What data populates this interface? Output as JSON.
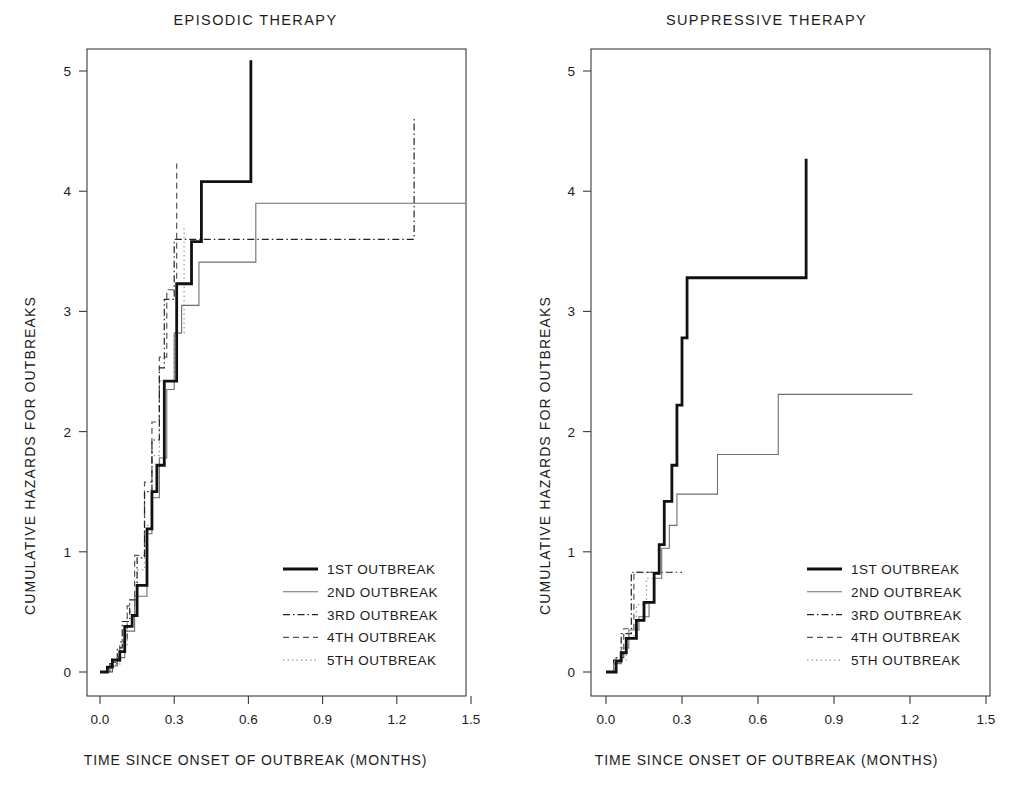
{
  "figure": {
    "width": 1022,
    "height": 795,
    "background": "#ffffff"
  },
  "panels": [
    {
      "id": "episodic",
      "title": "EPISODIC THERAPY",
      "xlabel": "TIME SINCE ONSET OF OUTBREAK (MONTHS)",
      "ylabel": "CUMULATIVE HAZARDS FOR OUTBREAKS",
      "x_ticks": [
        "0.0",
        "0.3",
        "0.6",
        "0.9",
        "1.2",
        "1.5"
      ],
      "y_ticks": [
        "0",
        "1",
        "2",
        "3",
        "4",
        "5"
      ]
    },
    {
      "id": "suppressive",
      "title": "SUPPRESSIVE THERAPY",
      "xlabel": "TIME SINCE ONSET OF OUTBREAK (MONTHS)",
      "ylabel": "CUMULATIVE HAZARDS FOR OUTBREAKS",
      "x_ticks": [
        "0.0",
        "0.3",
        "0.6",
        "0.9",
        "1.2",
        "1.5"
      ],
      "y_ticks": [
        "0",
        "1",
        "2",
        "3",
        "4",
        "5"
      ]
    }
  ],
  "legend": {
    "entries": [
      {
        "label": "1ST OUTBREAK",
        "style": "solid-thick",
        "color": "#111111",
        "width": 2.8,
        "dash": "none"
      },
      {
        "label": "2ND OUTBREAK",
        "style": "solid-thin",
        "color": "#6e6e6e",
        "width": 1.1,
        "dash": "none"
      },
      {
        "label": "3RD OUTBREAK",
        "style": "dash-dot",
        "color": "#222222",
        "width": 1.2,
        "dash": "7,3,1.5,3"
      },
      {
        "label": "4TH OUTBREAK",
        "style": "dashed",
        "color": "#555555",
        "width": 1.2,
        "dash": "6,4"
      },
      {
        "label": "5TH OUTBREAK",
        "style": "dotted",
        "color": "#9a9a9a",
        "width": 1.2,
        "dash": "1.5,3"
      }
    ]
  },
  "chart_data": {
    "type": "line",
    "subtype": "step-function (Nelson-Aalen cumulative hazard)",
    "xlabel": "TIME SINCE ONSET OF OUTBREAK (MONTHS)",
    "ylabel": "CUMULATIVE HAZARDS FOR OUTBREAKS",
    "xlim": [
      -0.07,
      1.62
    ],
    "ylim": [
      -0.23,
      5.45
    ],
    "xticks": [
      0.0,
      0.3,
      0.6,
      0.9,
      1.2,
      1.5
    ],
    "yticks": [
      0,
      1,
      2,
      3,
      4,
      5
    ],
    "grid": false,
    "legend_position": "lower right (inside panel)",
    "panels": [
      {
        "panel": "EPISODIC THERAPY",
        "series": [
          {
            "name": "1ST OUTBREAK",
            "style": "solid-thick",
            "points": [
              [
                0.0,
                0.0
              ],
              [
                0.03,
                0.0
              ],
              [
                0.03,
                0.04
              ],
              [
                0.05,
                0.04
              ],
              [
                0.05,
                0.1
              ],
              [
                0.08,
                0.1
              ],
              [
                0.08,
                0.17
              ],
              [
                0.1,
                0.17
              ],
              [
                0.1,
                0.38
              ],
              [
                0.13,
                0.38
              ],
              [
                0.13,
                0.47
              ],
              [
                0.15,
                0.47
              ],
              [
                0.15,
                0.72
              ],
              [
                0.19,
                0.72
              ],
              [
                0.19,
                1.19
              ],
              [
                0.21,
                1.19
              ],
              [
                0.21,
                1.5
              ],
              [
                0.23,
                1.5
              ],
              [
                0.23,
                1.72
              ],
              [
                0.26,
                1.72
              ],
              [
                0.26,
                2.42
              ],
              [
                0.31,
                2.42
              ],
              [
                0.31,
                3.23
              ],
              [
                0.37,
                3.23
              ],
              [
                0.37,
                3.58
              ],
              [
                0.41,
                3.58
              ],
              [
                0.41,
                4.08
              ],
              [
                0.61,
                4.08
              ],
              [
                0.61,
                5.09
              ]
            ]
          },
          {
            "name": "2ND OUTBREAK",
            "style": "solid-thin",
            "points": [
              [
                0.0,
                0.0
              ],
              [
                0.04,
                0.0
              ],
              [
                0.04,
                0.05
              ],
              [
                0.07,
                0.05
              ],
              [
                0.07,
                0.12
              ],
              [
                0.1,
                0.12
              ],
              [
                0.1,
                0.34
              ],
              [
                0.14,
                0.34
              ],
              [
                0.14,
                0.63
              ],
              [
                0.19,
                0.63
              ],
              [
                0.19,
                1.15
              ],
              [
                0.21,
                1.15
              ],
              [
                0.21,
                1.45
              ],
              [
                0.24,
                1.45
              ],
              [
                0.24,
                1.78
              ],
              [
                0.27,
                1.78
              ],
              [
                0.27,
                2.35
              ],
              [
                0.3,
                2.35
              ],
              [
                0.3,
                2.82
              ],
              [
                0.33,
                2.82
              ],
              [
                0.33,
                3.05
              ],
              [
                0.4,
                3.05
              ],
              [
                0.4,
                3.41
              ],
              [
                0.63,
                3.41
              ],
              [
                0.63,
                3.9
              ],
              [
                1.56,
                3.9
              ]
            ]
          },
          {
            "name": "3RD OUTBREAK",
            "style": "dash-dot",
            "points": [
              [
                0.0,
                0.0
              ],
              [
                0.04,
                0.0
              ],
              [
                0.04,
                0.07
              ],
              [
                0.07,
                0.07
              ],
              [
                0.07,
                0.2
              ],
              [
                0.09,
                0.2
              ],
              [
                0.09,
                0.42
              ],
              [
                0.12,
                0.42
              ],
              [
                0.12,
                0.6
              ],
              [
                0.15,
                0.6
              ],
              [
                0.15,
                0.95
              ],
              [
                0.18,
                0.95
              ],
              [
                0.18,
                1.5
              ],
              [
                0.21,
                1.5
              ],
              [
                0.21,
                1.93
              ],
              [
                0.24,
                1.93
              ],
              [
                0.24,
                2.53
              ],
              [
                0.26,
                2.53
              ],
              [
                0.26,
                3.1
              ],
              [
                0.3,
                3.1
              ],
              [
                0.3,
                3.6
              ],
              [
                1.27,
                3.6
              ],
              [
                1.27,
                4.6
              ]
            ]
          },
          {
            "name": "4TH OUTBREAK",
            "style": "dashed",
            "points": [
              [
                0.0,
                0.0
              ],
              [
                0.05,
                0.0
              ],
              [
                0.05,
                0.08
              ],
              [
                0.08,
                0.08
              ],
              [
                0.08,
                0.25
              ],
              [
                0.11,
                0.25
              ],
              [
                0.11,
                0.55
              ],
              [
                0.14,
                0.55
              ],
              [
                0.14,
                0.97
              ],
              [
                0.18,
                0.97
              ],
              [
                0.18,
                1.58
              ],
              [
                0.21,
                1.58
              ],
              [
                0.21,
                2.08
              ],
              [
                0.24,
                2.08
              ],
              [
                0.24,
                2.62
              ],
              [
                0.27,
                2.62
              ],
              [
                0.27,
                3.18
              ],
              [
                0.31,
                3.18
              ],
              [
                0.31,
                4.23
              ]
            ]
          },
          {
            "name": "5TH OUTBREAK",
            "style": "dotted",
            "points": [
              [
                0.0,
                0.0
              ],
              [
                0.04,
                0.0
              ],
              [
                0.04,
                0.06
              ],
              [
                0.08,
                0.06
              ],
              [
                0.08,
                0.22
              ],
              [
                0.11,
                0.22
              ],
              [
                0.11,
                0.5
              ],
              [
                0.15,
                0.5
              ],
              [
                0.15,
                0.85
              ],
              [
                0.18,
                0.85
              ],
              [
                0.18,
                1.22
              ],
              [
                0.21,
                1.22
              ],
              [
                0.21,
                1.8
              ],
              [
                0.24,
                1.8
              ],
              [
                0.24,
                2.42
              ],
              [
                0.3,
                2.42
              ],
              [
                0.3,
                2.82
              ],
              [
                0.34,
                2.82
              ],
              [
                0.34,
                3.72
              ]
            ]
          }
        ]
      },
      {
        "panel": "SUPPRESSIVE THERAPY",
        "series": [
          {
            "name": "1ST OUTBREAK",
            "style": "solid-thick",
            "points": [
              [
                0.0,
                0.0
              ],
              [
                0.04,
                0.0
              ],
              [
                0.04,
                0.09
              ],
              [
                0.06,
                0.09
              ],
              [
                0.06,
                0.16
              ],
              [
                0.08,
                0.16
              ],
              [
                0.08,
                0.28
              ],
              [
                0.12,
                0.28
              ],
              [
                0.12,
                0.43
              ],
              [
                0.15,
                0.43
              ],
              [
                0.15,
                0.58
              ],
              [
                0.19,
                0.58
              ],
              [
                0.19,
                0.82
              ],
              [
                0.21,
                0.82
              ],
              [
                0.21,
                1.06
              ],
              [
                0.23,
                1.06
              ],
              [
                0.23,
                1.42
              ],
              [
                0.26,
                1.42
              ],
              [
                0.26,
                1.72
              ],
              [
                0.28,
                1.72
              ],
              [
                0.28,
                2.22
              ],
              [
                0.3,
                2.22
              ],
              [
                0.3,
                2.78
              ],
              [
                0.32,
                2.78
              ],
              [
                0.32,
                3.28
              ],
              [
                0.79,
                3.28
              ],
              [
                0.79,
                4.27
              ]
            ]
          },
          {
            "name": "2ND OUTBREAK",
            "style": "solid-thin",
            "points": [
              [
                0.0,
                0.0
              ],
              [
                0.03,
                0.0
              ],
              [
                0.03,
                0.07
              ],
              [
                0.06,
                0.07
              ],
              [
                0.06,
                0.2
              ],
              [
                0.09,
                0.2
              ],
              [
                0.09,
                0.35
              ],
              [
                0.13,
                0.35
              ],
              [
                0.13,
                0.46
              ],
              [
                0.17,
                0.46
              ],
              [
                0.17,
                0.58
              ],
              [
                0.19,
                0.58
              ],
              [
                0.19,
                0.78
              ],
              [
                0.22,
                0.78
              ],
              [
                0.22,
                1.03
              ],
              [
                0.25,
                1.03
              ],
              [
                0.25,
                1.22
              ],
              [
                0.28,
                1.22
              ],
              [
                0.28,
                1.48
              ],
              [
                0.44,
                1.48
              ],
              [
                0.44,
                1.81
              ],
              [
                0.68,
                1.81
              ],
              [
                0.68,
                2.31
              ],
              [
                1.21,
                2.31
              ]
            ]
          },
          {
            "name": "3RD OUTBREAK",
            "style": "dash-dot",
            "points": [
              [
                0.0,
                0.0
              ],
              [
                0.03,
                0.0
              ],
              [
                0.03,
                0.1
              ],
              [
                0.06,
                0.1
              ],
              [
                0.06,
                0.32
              ],
              [
                0.1,
                0.32
              ],
              [
                0.1,
                0.83
              ],
              [
                0.3,
                0.83
              ]
            ]
          },
          {
            "name": "4TH OUTBREAK",
            "style": "dashed",
            "points": [
              [
                0.0,
                0.0
              ],
              [
                0.04,
                0.0
              ],
              [
                0.04,
                0.12
              ],
              [
                0.07,
                0.12
              ],
              [
                0.07,
                0.36
              ],
              [
                0.11,
                0.36
              ],
              [
                0.11,
                0.83
              ],
              [
                0.2,
                0.83
              ]
            ]
          },
          {
            "name": "5TH OUTBREAK",
            "style": "dotted",
            "points": [
              [
                0.0,
                0.0
              ],
              [
                0.04,
                0.0
              ],
              [
                0.04,
                0.1
              ],
              [
                0.08,
                0.1
              ],
              [
                0.08,
                0.3
              ],
              [
                0.12,
                0.3
              ],
              [
                0.12,
                0.56
              ],
              [
                0.16,
                0.56
              ],
              [
                0.16,
                0.78
              ],
              [
                0.2,
                0.78
              ]
            ]
          }
        ]
      }
    ]
  }
}
